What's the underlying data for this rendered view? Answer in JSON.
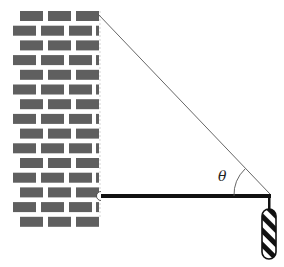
{
  "diagram": {
    "title": "",
    "labels": {
      "angle": "θ"
    },
    "elements": {
      "wall": {
        "type": "brick-wall",
        "brick_color": "#5f5f5f",
        "edge_x": 100,
        "top_y": 11,
        "bottom_y": 217
      },
      "beam": {
        "type": "horizontal-rod",
        "color": "#111111",
        "from": [
          101,
          196
        ],
        "to": [
          270,
          196
        ],
        "thickness": 4
      },
      "hinge": {
        "type": "pivot",
        "at": [
          100,
          196
        ]
      },
      "cable": {
        "type": "string",
        "color": "#555555",
        "from": [
          98,
          14
        ],
        "to": [
          270,
          194
        ]
      },
      "angle_marker": {
        "type": "arc",
        "between": [
          "cable",
          "beam"
        ],
        "vertex": [
          270,
          196
        ],
        "label": "θ"
      },
      "hanger": {
        "type": "vertical-link",
        "from": [
          269,
          198
        ],
        "to": [
          269,
          209
        ]
      },
      "weight": {
        "type": "striped-capsule",
        "x": 262,
        "y": 209,
        "width": 14,
        "height": 50,
        "stripe_colors": [
          "#111111",
          "#ffffff"
        ]
      }
    }
  }
}
